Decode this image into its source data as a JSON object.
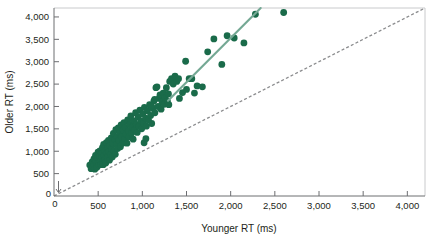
{
  "chart_data": {
    "type": "scatter",
    "title": "",
    "xlabel": "Younger RT (ms)",
    "ylabel": "Older RT (ms)",
    "xlim": [
      0,
      4200
    ],
    "ylim": [
      0,
      4200
    ],
    "xticks": [
      0,
      500,
      1000,
      1500,
      2000,
      2500,
      3000,
      3500,
      4000
    ],
    "xtick_labels": [
      "0",
      "500",
      "1,000",
      "1,500",
      "2,000",
      "2,500",
      "3,000",
      "3,500",
      "4,000"
    ],
    "yticks": [
      0,
      500,
      1000,
      1500,
      2000,
      2500,
      3000,
      3500,
      4000
    ],
    "ytick_labels": [
      "0",
      "500",
      "1,000",
      "1,500",
      "2,000",
      "2,500",
      "3,000",
      "3,500",
      "4,000"
    ],
    "grid": false,
    "legend": null,
    "point_color": "#1a6b4a",
    "point_radius": 3.4,
    "fit_line": {
      "name": "regression-line",
      "color": "#74a894",
      "style": "solid",
      "x": [
        1290,
        2340
      ],
      "y": [
        2130,
        4270
      ]
    },
    "identity_line": {
      "name": "identity-line",
      "color": "#8b8c8e",
      "style": "dashed",
      "x": [
        0,
        4200
      ],
      "y": [
        0,
        4200
      ]
    },
    "points": [
      [
        405,
        690
      ],
      [
        420,
        610
      ],
      [
        432,
        760
      ],
      [
        440,
        655
      ],
      [
        452,
        830
      ],
      [
        455,
        700
      ],
      [
        462,
        600
      ],
      [
        470,
        905
      ],
      [
        472,
        770
      ],
      [
        480,
        700
      ],
      [
        486,
        640
      ],
      [
        492,
        845
      ],
      [
        498,
        980
      ],
      [
        502,
        735
      ],
      [
        508,
        690
      ],
      [
        515,
        880
      ],
      [
        520,
        1010
      ],
      [
        524,
        780
      ],
      [
        530,
        700
      ],
      [
        536,
        950
      ],
      [
        542,
        860
      ],
      [
        548,
        1080
      ],
      [
        552,
        760
      ],
      [
        558,
        700
      ],
      [
        562,
        1150
      ],
      [
        568,
        905
      ],
      [
        575,
        820
      ],
      [
        580,
        1010
      ],
      [
        586,
        740
      ],
      [
        592,
        1190
      ],
      [
        598,
        950
      ],
      [
        604,
        860
      ],
      [
        610,
        1080
      ],
      [
        616,
        1240
      ],
      [
        622,
        990
      ],
      [
        628,
        800
      ],
      [
        634,
        1130
      ],
      [
        640,
        920
      ],
      [
        648,
        1300
      ],
      [
        654,
        1050
      ],
      [
        660,
        870
      ],
      [
        666,
        1180
      ],
      [
        672,
        1400
      ],
      [
        680,
        1010
      ],
      [
        688,
        1260
      ],
      [
        694,
        930
      ],
      [
        700,
        1480
      ],
      [
        708,
        1150
      ],
      [
        714,
        1320
      ],
      [
        720,
        1060
      ],
      [
        728,
        1520
      ],
      [
        736,
        1240
      ],
      [
        744,
        1400
      ],
      [
        752,
        1100
      ],
      [
        760,
        1590
      ],
      [
        768,
        1320
      ],
      [
        776,
        1180
      ],
      [
        784,
        1470
      ],
      [
        792,
        1640
      ],
      [
        800,
        1280
      ],
      [
        810,
        1530
      ],
      [
        818,
        1390
      ],
      [
        826,
        1180
      ],
      [
        834,
        1700
      ],
      [
        842,
        1450
      ],
      [
        850,
        1320
      ],
      [
        860,
        1600
      ],
      [
        870,
        1790
      ],
      [
        878,
        1400
      ],
      [
        886,
        1540
      ],
      [
        896,
        1270
      ],
      [
        904,
        1680
      ],
      [
        914,
        1480
      ],
      [
        924,
        1860
      ],
      [
        932,
        1600
      ],
      [
        942,
        1420
      ],
      [
        952,
        1760
      ],
      [
        962,
        1560
      ],
      [
        972,
        1920
      ],
      [
        982,
        1680
      ],
      [
        992,
        1500
      ],
      [
        1004,
        1840
      ],
      [
        1014,
        1620
      ],
      [
        1024,
        1980
      ],
      [
        1036,
        1740
      ],
      [
        1020,
        1190
      ],
      [
        1046,
        1560
      ],
      [
        1058,
        1900
      ],
      [
        1070,
        1700
      ],
      [
        1082,
        2040
      ],
      [
        1094,
        1800
      ],
      [
        1106,
        1620
      ],
      [
        1118,
        1960
      ],
      [
        1130,
        2120
      ],
      [
        1142,
        1860
      ],
      [
        1154,
        2420
      ],
      [
        1166,
        2440
      ],
      [
        1178,
        2000
      ],
      [
        1190,
        2180
      ],
      [
        1200,
        2260
      ],
      [
        1212,
        1940
      ],
      [
        1224,
        2100
      ],
      [
        1236,
        2300
      ],
      [
        1248,
        2050
      ],
      [
        1260,
        2190
      ],
      [
        1272,
        2420
      ],
      [
        1284,
        2120
      ],
      [
        1296,
        2280
      ],
      [
        1100,
        2020
      ],
      [
        1140,
        2160
      ],
      [
        1040,
        1280
      ],
      [
        1310,
        2560
      ],
      [
        1330,
        2620
      ],
      [
        1350,
        2500
      ],
      [
        1370,
        2680
      ],
      [
        1390,
        2560
      ],
      [
        1410,
        2620
      ],
      [
        1300,
        2040
      ],
      [
        1455,
        2310
      ],
      [
        1490,
        3010
      ],
      [
        1530,
        2620
      ],
      [
        1560,
        2620
      ],
      [
        1620,
        2460
      ],
      [
        1680,
        2440
      ],
      [
        1740,
        3220
      ],
      [
        1810,
        3510
      ],
      [
        1900,
        2940
      ],
      [
        1960,
        3580
      ],
      [
        2040,
        3530
      ],
      [
        2150,
        3420
      ],
      [
        2280,
        4060
      ],
      [
        2600,
        4100
      ],
      [
        1420,
        2180
      ],
      [
        1500,
        2380
      ],
      [
        1590,
        2300
      ]
    ]
  }
}
